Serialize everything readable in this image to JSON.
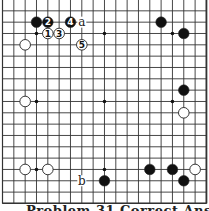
{
  "board": {
    "size": 19,
    "stone_colors": {
      "black": "#111111",
      "white": "#ffffff",
      "line": "#333333"
    },
    "star_points": [
      [
        4,
        4
      ],
      [
        10,
        4
      ],
      [
        16,
        4
      ],
      [
        4,
        10
      ],
      [
        10,
        10
      ],
      [
        16,
        10
      ],
      [
        4,
        16
      ],
      [
        10,
        16
      ],
      [
        16,
        16
      ]
    ],
    "stones": [
      {
        "color": "black",
        "col": 4,
        "row": 3,
        "label": ""
      },
      {
        "color": "black",
        "col": 5,
        "row": 3,
        "label": "2"
      },
      {
        "color": "black",
        "col": 7,
        "row": 3,
        "label": "4"
      },
      {
        "color": "white",
        "col": 5,
        "row": 4,
        "label": "1"
      },
      {
        "color": "white",
        "col": 6,
        "row": 4,
        "label": "3"
      },
      {
        "color": "white",
        "col": 8,
        "row": 5,
        "label": "5"
      },
      {
        "color": "white",
        "col": 3,
        "row": 5,
        "label": ""
      },
      {
        "color": "black",
        "col": 15,
        "row": 3,
        "label": ""
      },
      {
        "color": "black",
        "col": 17,
        "row": 4,
        "label": ""
      },
      {
        "color": "black",
        "col": 17,
        "row": 9,
        "label": ""
      },
      {
        "color": "white",
        "col": 17,
        "row": 11,
        "label": ""
      },
      {
        "color": "white",
        "col": 3,
        "row": 10,
        "label": ""
      },
      {
        "color": "white",
        "col": 3,
        "row": 16,
        "label": ""
      },
      {
        "color": "white",
        "col": 5,
        "row": 16,
        "label": ""
      },
      {
        "color": "black",
        "col": 10,
        "row": 17,
        "label": ""
      },
      {
        "color": "black",
        "col": 14,
        "row": 16,
        "label": ""
      },
      {
        "color": "black",
        "col": 16,
        "row": 16,
        "label": ""
      },
      {
        "color": "black",
        "col": 17,
        "row": 17,
        "label": ""
      },
      {
        "color": "white",
        "col": 18,
        "row": 16,
        "label": ""
      }
    ],
    "letters": [
      {
        "text": "a",
        "col": 8,
        "row": 3
      },
      {
        "text": "b",
        "col": 8,
        "row": 17
      }
    ]
  },
  "caption": "Problem 31 Correct Answer"
}
